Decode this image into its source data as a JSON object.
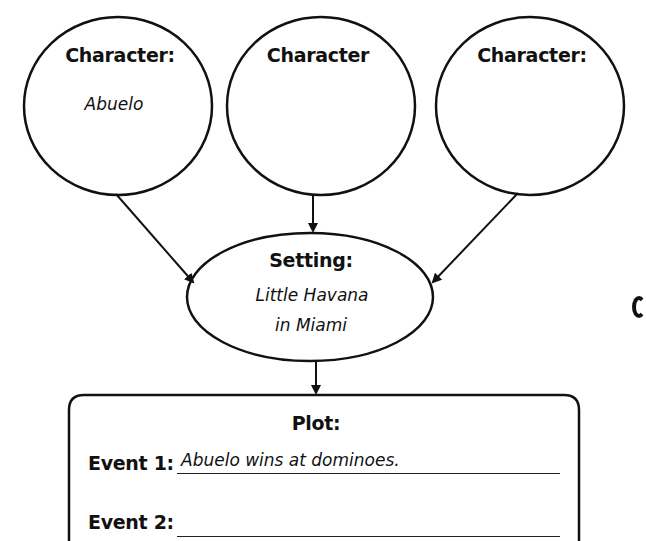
{
  "diagram": {
    "characters": [
      {
        "label": "Character:",
        "value": "Abuelo"
      },
      {
        "label": "Character",
        "value": ""
      },
      {
        "label": "Character:",
        "value": ""
      }
    ],
    "setting": {
      "label": "Setting:",
      "value_line1": "Little Havana",
      "value_line2": "in Miami"
    },
    "plot": {
      "label": "Plot:",
      "events": [
        {
          "label": "Event 1:",
          "value": "Abuelo wins at dominoes."
        },
        {
          "label": "Event 2:",
          "value": ""
        }
      ]
    },
    "colors": {
      "stroke": "#111111",
      "background": "#ffffff"
    }
  }
}
